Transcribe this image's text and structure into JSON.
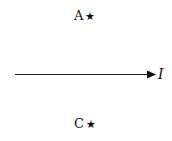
{
  "diagram": {
    "points": [
      {
        "label": "A",
        "marker": "★"
      },
      {
        "label": "C",
        "marker": "★"
      }
    ],
    "arrow": {
      "label": "I",
      "direction": "right"
    }
  }
}
